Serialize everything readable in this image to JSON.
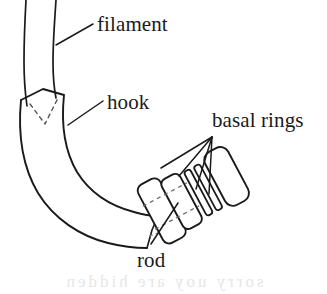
{
  "figure": {
    "background_color": "#ffffff",
    "ink_color": "#1a1a1a",
    "width": 327,
    "height": 294
  },
  "labels": {
    "filament": "filament",
    "hook": "hook",
    "basal_rings": "basal rings",
    "rod": "rod"
  },
  "artifact": {
    "bleed_through_text": "sorry uoy are hidden"
  },
  "parts": {
    "filament": {
      "name": "filament",
      "description": "two long curved lines running off the top edge of the image"
    },
    "hook": {
      "name": "hook",
      "description": "thick curved band bending from upper-left down to lower-right"
    },
    "rod": {
      "name": "rod",
      "description": "dashed axis line passing through the basal ring stack"
    },
    "basal_rings": {
      "name": "basal rings",
      "count": 4,
      "description": "stack of four ring blocks at the base, two wide blocks then two thin rings then a terminal block"
    }
  },
  "leader_lines": {
    "filament_leader": "from filament label down-left to the filament outline",
    "hook_leader": "from hook label down-left to the hook band",
    "rod_leader": "from rod label up-right into the ring stack",
    "basal_rings_leaders": 4
  }
}
